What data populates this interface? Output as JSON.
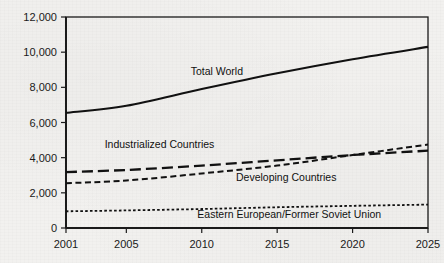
{
  "chart_data": {
    "type": "line",
    "title": "",
    "subtitle": "",
    "xlabel": "",
    "ylabel": "",
    "xlim": [
      2001,
      2025
    ],
    "ylim": [
      0,
      12000
    ],
    "grid": false,
    "legend_position": "inline-annotations",
    "x_ticks": [
      "2001",
      "2005",
      "2010",
      "2015",
      "2020",
      "2025"
    ],
    "x_tick_values": [
      2001,
      2005,
      2010,
      2015,
      2020,
      2025
    ],
    "y_ticks": [
      "0",
      "2,000",
      "4,000",
      "6,000",
      "8,000",
      "10,000",
      "12,000"
    ],
    "y_tick_values": [
      0,
      2000,
      4000,
      6000,
      8000,
      10000,
      12000
    ],
    "x": [
      2001,
      2005,
      2010,
      2015,
      2020,
      2025
    ],
    "series": [
      {
        "name": "Total World",
        "style": "solid",
        "color": "#111111",
        "values": [
          6550,
          6950,
          7900,
          8800,
          9600,
          10300
        ],
        "label_x": 2011.0,
        "label_y": 8700
      },
      {
        "name": "Industrialized Countries",
        "style": "long-dash",
        "color": "#111111",
        "values": [
          3180,
          3300,
          3550,
          3850,
          4150,
          4400
        ],
        "label_x": 2007.2,
        "label_y": 4550
      },
      {
        "name": "Developing Countries",
        "style": "medium-dash",
        "color": "#111111",
        "values": [
          2550,
          2700,
          3100,
          3550,
          4150,
          4750
        ],
        "label_x": 2015.6,
        "label_y": 2650
      },
      {
        "name": "Eastern European/Former Soviet Union",
        "style": "fine-dot",
        "color": "#111111",
        "values": [
          950,
          1000,
          1080,
          1180,
          1260,
          1330
        ],
        "label_x": 2015.8,
        "label_y": 580
      }
    ]
  }
}
